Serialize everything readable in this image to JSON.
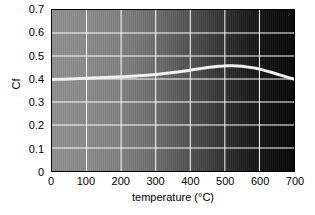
{
  "chart_data": {
    "type": "line",
    "title": "",
    "xlabel": "temperature (°C)",
    "ylabel": "Cf",
    "xlim": [
      0,
      700
    ],
    "ylim": [
      0,
      0.7
    ],
    "grid": true,
    "legend": null,
    "xticks": [
      "0",
      "100",
      "200",
      "300",
      "400",
      "500",
      "600",
      "700"
    ],
    "xtick_values": [
      0,
      100,
      200,
      300,
      400,
      500,
      600,
      700
    ],
    "yticks": [
      "0",
      "0.1",
      "0.2",
      "0.3",
      "0.4",
      "0.5",
      "0.6",
      "0.7"
    ],
    "ytick_values": [
      0,
      0.1,
      0.2,
      0.3,
      0.4,
      0.5,
      0.6,
      0.7
    ],
    "background": "horizontal gradient light-gray to black",
    "gridline_color": "#ffffff",
    "line_color": "#f0f0f0",
    "line_width_px": 3,
    "series": [
      {
        "name": "Cf",
        "x": [
          0,
          25,
          50,
          100,
          150,
          200,
          250,
          300,
          350,
          400,
          450,
          480,
          500,
          520,
          550,
          600,
          650,
          680,
          700
        ],
        "values": [
          0.398,
          0.399,
          0.4,
          0.403,
          0.406,
          0.41,
          0.414,
          0.42,
          0.428,
          0.438,
          0.45,
          0.455,
          0.457,
          0.458,
          0.455,
          0.443,
          0.422,
          0.408,
          0.4
        ]
      }
    ]
  },
  "axes": {
    "y_title": "Cf",
    "x_title": "temperature (°C)"
  },
  "colors": {
    "gradient_left": "#8f8f8f",
    "gradient_right": "#060606",
    "grid": "#ffffff",
    "curve": "#f0f0f0",
    "frame": "#000000",
    "text": "#000000"
  }
}
